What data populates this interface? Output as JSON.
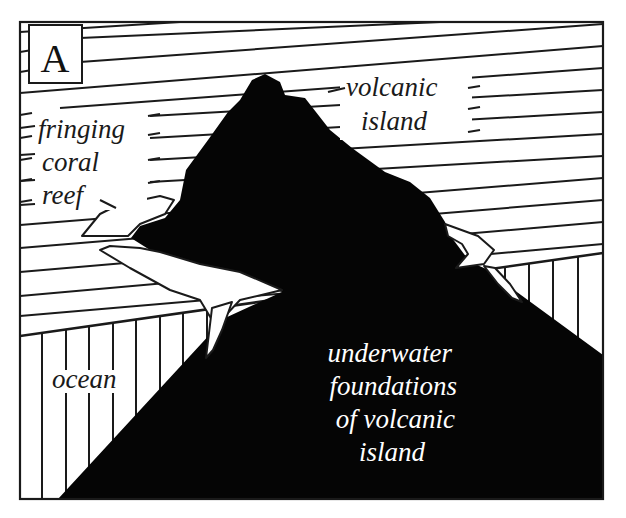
{
  "diagram": {
    "panel_label": "A",
    "colors": {
      "ink": "#050505",
      "line": "#1a1a1a",
      "background": "#ffffff"
    },
    "labels": {
      "reef": [
        "fringing",
        "coral",
        "reef"
      ],
      "island": [
        "volcanic",
        "island"
      ],
      "ocean": "ocean",
      "foundations": [
        "underwater",
        "foundations",
        "of volcanic",
        "island"
      ]
    },
    "regions": {
      "sky": "diagonal hatching (air / sea surface in perspective)",
      "sea": "vertical hatching (ocean cross-section)",
      "island": "solid black (volcanic island and underwater foundation)",
      "reef": "white band ringing the island at sea level"
    }
  }
}
